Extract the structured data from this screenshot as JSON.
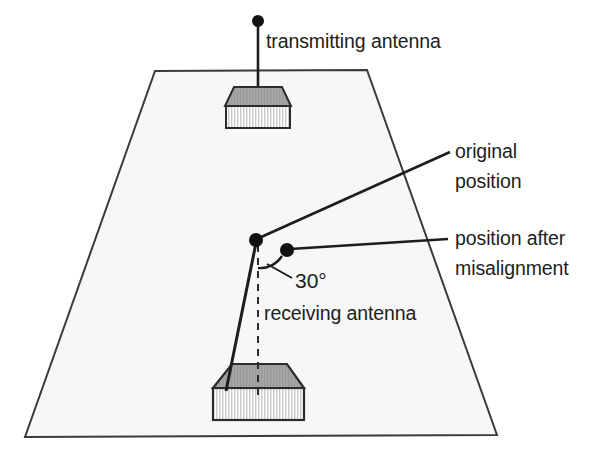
{
  "diagram": {
    "colors": {
      "ground_fill": "#f7f7f7",
      "ground_stroke": "#3b3b3b",
      "roof_fill": "#a8a8a8",
      "wall_fill": "#d8d8d8",
      "building_stroke": "#2b2b2b",
      "line_stroke": "#1d1d1d",
      "text": "#1d1d1d",
      "hatch": "#b4b4b4"
    },
    "ground": {
      "name": "ground-plane-trapezoid",
      "points": "155,71 367,70 497,435 25,437"
    },
    "transmitting": {
      "label": "transmitting antenna",
      "label_x": 266,
      "label_y": 48,
      "mast": {
        "x": 258,
        "y1": 21,
        "y2": 108
      },
      "dot": {
        "cx": 258,
        "cy": 21,
        "r": 6
      },
      "building": {
        "roof": "234,87 282,87 291,106 225,106",
        "wall": {
          "x": 226,
          "y": 106,
          "w": 64,
          "h": 22
        }
      }
    },
    "receiving": {
      "label": "receiving antenna",
      "label_x": 264,
      "label_y": 320,
      "building": {
        "roof": "232,364 287,364 304,388 213,388",
        "wall": {
          "x": 213,
          "y": 388,
          "w": 91,
          "h": 32
        }
      },
      "dashed_axis": {
        "x": 258,
        "y1": 245,
        "y2": 400
      },
      "tilted_mast": "256,243 226,391"
    },
    "original_position": {
      "label_line_1": "original",
      "label_line_2": "position",
      "label_x": 455,
      "label_y_1": 158,
      "label_y_2": 188,
      "dot": {
        "cx": 256,
        "cy": 240,
        "r": 7
      },
      "leader": "259,238 450,152"
    },
    "misaligned_position": {
      "label_line_1": "position after",
      "label_line_2": "misalignment",
      "label_x": 455,
      "label_y_1": 245,
      "label_y_2": 275,
      "dot": {
        "cx": 287,
        "cy": 250,
        "r": 7
      },
      "leader": "290,249 448,239"
    },
    "angle": {
      "value": "30°",
      "label_x": 295,
      "label_y": 288,
      "arc_path": "M 258,268 A 26,26 0 0 0 282,256",
      "pointer": "292,278 267,264"
    }
  }
}
